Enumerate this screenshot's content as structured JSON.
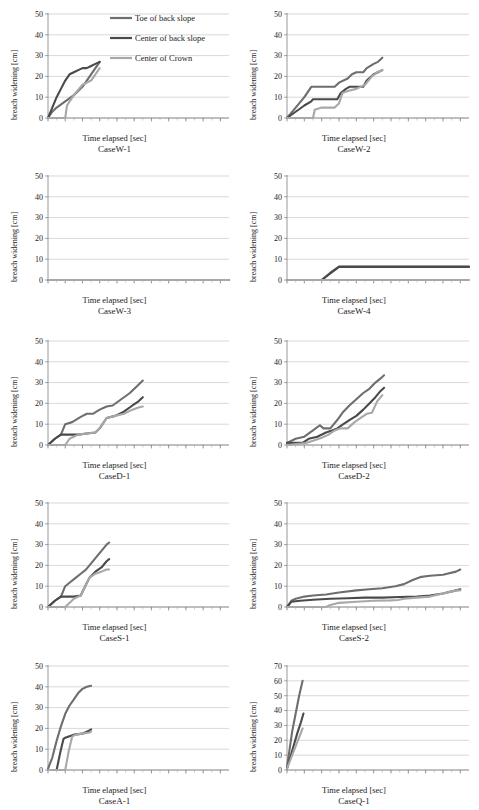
{
  "figure": {
    "axis_x_label": "Time elapsed [sec]",
    "axis_y_label": "breach widening [cm]",
    "x_ticks": [
      0,
      20,
      40,
      60,
      80,
      100,
      120,
      140,
      160,
      180,
      200
    ],
    "y_ticks_50": [
      0,
      10,
      20,
      30,
      40,
      50
    ],
    "y_ticks_70": [
      0,
      10,
      20,
      30,
      40,
      50,
      60,
      70
    ]
  },
  "legend": {
    "position": "top-right of first panel",
    "items": [
      {
        "label": "Toe of back slope",
        "color": "#6e6e6e"
      },
      {
        "label": "Center of back slope",
        "color": "#4a4a4a"
      },
      {
        "label": "Center of Crown",
        "color": "#a8a8a8"
      }
    ]
  },
  "colors": {
    "toe_of_back_slope": "#6e6e6e",
    "center_of_back_slope": "#4a4a4a",
    "center_of_crown": "#a8a8a8",
    "gridline": "#bdbdbd",
    "axis": "#7d7d7d",
    "text": "#1c1c1c"
  },
  "chart_data": [
    {
      "type": "line",
      "title": "CaseW-1",
      "xlabel": "Time elapsed [sec]",
      "ylabel": "breach widening [cm]",
      "xlim": [
        0,
        210
      ],
      "ylim": [
        0,
        50
      ],
      "grid": true,
      "legend": true,
      "series": [
        {
          "name": "Toe of back slope",
          "color": "#6e6e6e",
          "x": [
            0,
            5,
            10,
            20,
            30,
            40,
            45,
            50,
            55,
            60
          ],
          "y": [
            0,
            3,
            5,
            8,
            11,
            15,
            18,
            21,
            24,
            27
          ]
        },
        {
          "name": "Center of back slope",
          "color": "#4a4a4a",
          "x": [
            0,
            5,
            10,
            15,
            20,
            25,
            30,
            35,
            40,
            45,
            50,
            55,
            60
          ],
          "y": [
            0,
            5,
            10,
            14,
            18,
            21,
            22,
            23,
            24,
            24,
            25,
            26,
            27
          ]
        },
        {
          "name": "Center of Crown",
          "color": "#a8a8a8",
          "x": [
            0,
            20,
            22,
            30,
            40,
            50,
            55,
            60
          ],
          "y": [
            0,
            0,
            6,
            11,
            16,
            18,
            21,
            24
          ]
        }
      ]
    },
    {
      "type": "line",
      "title": "CaseW-2",
      "xlabel": "Time elapsed [sec]",
      "ylabel": "breach widening [cm]",
      "xlim": [
        0,
        210
      ],
      "ylim": [
        0,
        50
      ],
      "grid": true,
      "legend": false,
      "series": [
        {
          "name": "Toe of back slope",
          "color": "#6e6e6e",
          "x": [
            0,
            10,
            20,
            28,
            30,
            55,
            60,
            70,
            75,
            80,
            88,
            92,
            100,
            105,
            110
          ],
          "y": [
            0,
            5,
            10,
            15,
            15,
            15,
            17,
            19,
            21,
            22,
            22,
            24,
            26,
            27,
            29
          ]
        },
        {
          "name": "Center of back slope",
          "color": "#4a4a4a",
          "x": [
            0,
            10,
            20,
            28,
            30,
            58,
            62,
            68,
            72,
            80,
            88,
            92,
            100,
            105,
            110
          ],
          "y": [
            0,
            3,
            6,
            8,
            9,
            9,
            12,
            14,
            15,
            15,
            15,
            18,
            21,
            22,
            23
          ]
        },
        {
          "name": "Center of Crown",
          "color": "#a8a8a8",
          "x": [
            0,
            30,
            32,
            40,
            55,
            60,
            64,
            70,
            80,
            90,
            98,
            104,
            110
          ],
          "y": [
            0,
            0,
            4,
            5,
            5,
            7,
            12,
            13,
            14,
            16,
            20,
            22,
            23
          ]
        }
      ]
    },
    {
      "type": "line",
      "title": "CaseW-3",
      "xlabel": "Time elapsed [sec]",
      "ylabel": "breach widening [cm]",
      "xlim": [
        0,
        210
      ],
      "ylim": [
        0,
        50
      ],
      "grid": true,
      "legend": false,
      "series": [
        {
          "name": "Toe of back slope",
          "color": "#6e6e6e",
          "x": [
            0,
            210
          ],
          "y": [
            0,
            0
          ]
        },
        {
          "name": "Center of back slope",
          "color": "#4a4a4a",
          "x": [
            0,
            210
          ],
          "y": [
            0,
            0
          ]
        },
        {
          "name": "Center of Crown",
          "color": "#a8a8a8",
          "x": [
            0,
            210
          ],
          "y": [
            0,
            0
          ]
        }
      ]
    },
    {
      "type": "line",
      "title": "CaseW-4",
      "xlabel": "Time elapsed [sec]",
      "ylabel": "breach widening [cm]",
      "xlim": [
        0,
        210
      ],
      "ylim": [
        0,
        50
      ],
      "grid": true,
      "legend": false,
      "series": [
        {
          "name": "Toe of back slope",
          "color": "#6e6e6e",
          "x": [
            0,
            40,
            50,
            60,
            210
          ],
          "y": [
            0,
            0,
            3.5,
            6.5,
            6.5
          ]
        },
        {
          "name": "Center of back slope",
          "color": "#4a4a4a",
          "x": [
            0,
            40,
            50,
            60,
            210
          ],
          "y": [
            0,
            0,
            3.2,
            6.3,
            6.3
          ]
        },
        {
          "name": "Center of Crown",
          "color": "#a8a8a8",
          "x": [
            0,
            210
          ],
          "y": [
            0,
            0
          ]
        }
      ]
    },
    {
      "type": "line",
      "title": "CaseD-1",
      "xlabel": "Time elapsed [sec]",
      "ylabel": "breach widening [cm]",
      "xlim": [
        0,
        210
      ],
      "ylim": [
        0,
        50
      ],
      "grid": true,
      "legend": false,
      "series": [
        {
          "name": "Toe of back slope",
          "color": "#6e6e6e",
          "x": [
            0,
            8,
            15,
            20,
            28,
            38,
            45,
            52,
            60,
            68,
            75,
            85,
            95,
            105,
            110
          ],
          "y": [
            0,
            3,
            5,
            10,
            11,
            13.5,
            15,
            15,
            17,
            18.5,
            19,
            22,
            25,
            29,
            31
          ]
        },
        {
          "name": "Center of back slope",
          "color": "#4a4a4a",
          "x": [
            0,
            8,
            15,
            20,
            35,
            45,
            55,
            60,
            68,
            78,
            88,
            98,
            105,
            110
          ],
          "y": [
            0,
            3,
            5,
            5,
            5,
            5.5,
            6,
            8,
            13,
            14,
            16,
            19,
            21,
            23
          ]
        },
        {
          "name": "Center of Crown",
          "color": "#a8a8a8",
          "x": [
            0,
            20,
            25,
            35,
            45,
            55,
            60,
            68,
            78,
            88,
            98,
            105,
            110
          ],
          "y": [
            0,
            0,
            3,
            5,
            5.5,
            6,
            8,
            13,
            14,
            15,
            17,
            18,
            18.5
          ]
        }
      ]
    },
    {
      "type": "line",
      "title": "CaseD-2",
      "xlabel": "Time elapsed [sec]",
      "ylabel": "breach widening [cm]",
      "xlim": [
        0,
        210
      ],
      "ylim": [
        0,
        50
      ],
      "grid": true,
      "legend": false,
      "series": [
        {
          "name": "Toe of back slope",
          "color": "#6e6e6e",
          "x": [
            0,
            10,
            20,
            30,
            38,
            42,
            50,
            58,
            65,
            72,
            80,
            88,
            95,
            102,
            108,
            112
          ],
          "y": [
            1,
            3,
            4,
            7,
            9.5,
            8,
            8,
            12,
            16,
            19,
            22,
            25,
            27,
            30,
            32,
            33.5
          ]
        },
        {
          "name": "Center of back slope",
          "color": "#4a4a4a",
          "x": [
            0,
            18,
            25,
            35,
            45,
            52,
            58,
            65,
            72,
            80,
            88,
            95,
            102,
            108,
            112
          ],
          "y": [
            1,
            1,
            3,
            4,
            6,
            7,
            8,
            10,
            12,
            14,
            17,
            20,
            23,
            26,
            27.5
          ]
        },
        {
          "name": "Center of Crown",
          "color": "#a8a8a8",
          "x": [
            0,
            22,
            30,
            40,
            48,
            55,
            62,
            70,
            78,
            85,
            92,
            98,
            104,
            110
          ],
          "y": [
            0,
            1,
            2,
            3.5,
            5,
            7,
            8,
            8,
            11,
            13,
            15,
            15.5,
            21,
            24
          ]
        }
      ]
    },
    {
      "type": "line",
      "title": "CaseS-1",
      "xlabel": "Time elapsed [sec]",
      "ylabel": "breach widening [cm]",
      "xlim": [
        0,
        210
      ],
      "ylim": [
        0,
        50
      ],
      "grid": true,
      "legend": false,
      "series": [
        {
          "name": "Toe of back slope",
          "color": "#6e6e6e",
          "x": [
            0,
            8,
            15,
            20,
            26,
            32,
            38,
            44,
            50,
            56,
            62,
            68,
            71
          ],
          "y": [
            0,
            3,
            5,
            10,
            12,
            14,
            16,
            18,
            21,
            24,
            27,
            30,
            31
          ]
        },
        {
          "name": "Center of back slope",
          "color": "#4a4a4a",
          "x": [
            0,
            8,
            15,
            20,
            30,
            38,
            42,
            48,
            55,
            62,
            68,
            71
          ],
          "y": [
            0,
            3,
            5,
            5,
            5,
            5.5,
            9,
            14,
            17,
            19,
            22,
            23
          ]
        },
        {
          "name": "Center of Crown",
          "color": "#a8a8a8",
          "x": [
            0,
            20,
            30,
            38,
            42,
            48,
            55,
            62,
            68,
            71
          ],
          "y": [
            0,
            0,
            4,
            5.5,
            9,
            14,
            16,
            17,
            18,
            18
          ]
        }
      ]
    },
    {
      "type": "line",
      "title": "CaseS-2",
      "xlabel": "Time elapsed [sec]",
      "ylabel": "breach widening [cm]",
      "xlim": [
        0,
        210
      ],
      "ylim": [
        0,
        50
      ],
      "grid": true,
      "legend": false,
      "series": [
        {
          "name": "Toe of back slope",
          "color": "#6e6e6e",
          "x": [
            0,
            5,
            10,
            20,
            30,
            45,
            60,
            80,
            95,
            110,
            125,
            135,
            145,
            155,
            165,
            180,
            195,
            200
          ],
          "y": [
            0,
            3,
            4,
            5,
            5.5,
            6,
            7,
            8,
            8.5,
            9,
            10,
            11,
            13,
            14.5,
            15,
            15.5,
            17,
            18
          ]
        },
        {
          "name": "Center of back slope",
          "color": "#4a4a4a",
          "x": [
            0,
            5,
            15,
            30,
            50,
            70,
            90,
            110,
            130,
            150,
            165,
            180,
            195,
            200
          ],
          "y": [
            0,
            2.5,
            3,
            3.5,
            4,
            4.2,
            4.5,
            4.5,
            4.8,
            5,
            5.5,
            6.5,
            8,
            8.5
          ]
        },
        {
          "name": "Center of Crown",
          "color": "#a8a8a8",
          "x": [
            0,
            45,
            50,
            60,
            80,
            100,
            120,
            128,
            135,
            150,
            165,
            180,
            195,
            200
          ],
          "y": [
            0,
            0,
            1,
            2,
            2.5,
            3,
            3.2,
            3.4,
            4,
            4.5,
            5,
            6.5,
            8,
            8
          ]
        }
      ]
    },
    {
      "type": "line",
      "title": "CaseA-1",
      "xlabel": "Time elapsed [sec]",
      "ylabel": "breach widening [cm]",
      "xlim": [
        0,
        210
      ],
      "ylim": [
        0,
        50
      ],
      "grid": true,
      "legend": false,
      "series": [
        {
          "name": "Toe of back slope",
          "color": "#6e6e6e",
          "x": [
            0,
            5,
            10,
            15,
            20,
            25,
            30,
            35,
            40,
            45,
            50
          ],
          "y": [
            0.5,
            6,
            14,
            21,
            27,
            31,
            34,
            37,
            39,
            40,
            40.5
          ]
        },
        {
          "name": "Center of back slope",
          "color": "#4a4a4a",
          "x": [
            0,
            10,
            14,
            18,
            20,
            30,
            40,
            48,
            50
          ],
          "y": [
            0,
            0,
            8,
            15,
            15.5,
            17,
            17.5,
            19,
            19.5
          ]
        },
        {
          "name": "Center of Crown",
          "color": "#a8a8a8",
          "x": [
            0,
            20,
            24,
            28,
            32,
            40,
            48,
            50
          ],
          "y": [
            0,
            0,
            9,
            16,
            17,
            17.5,
            18,
            18.5
          ]
        }
      ]
    },
    {
      "type": "line",
      "title": "CaseQ-1",
      "xlabel": "Time elapsed [sec]",
      "ylabel": "breach widening [cm]",
      "xlim": [
        0,
        210
      ],
      "ylim": [
        0,
        70
      ],
      "grid": true,
      "legend": false,
      "series": [
        {
          "name": "Toe of back slope",
          "color": "#6e6e6e",
          "x": [
            0,
            3,
            6,
            10,
            14,
            18
          ],
          "y": [
            2,
            14,
            26,
            38,
            50,
            60
          ]
        },
        {
          "name": "Center of back slope",
          "color": "#4a4a4a",
          "x": [
            0,
            4,
            8,
            12,
            16,
            19
          ],
          "y": [
            1,
            9,
            17,
            25,
            32,
            38
          ]
        },
        {
          "name": "Center of Crown",
          "color": "#a8a8a8",
          "x": [
            0,
            4,
            8,
            12,
            16,
            18
          ],
          "y": [
            1,
            7,
            13,
            19,
            25,
            28
          ]
        }
      ]
    }
  ]
}
